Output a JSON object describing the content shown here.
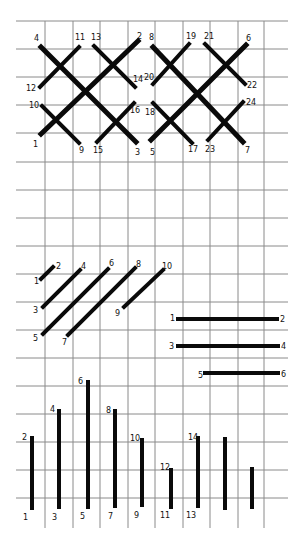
{
  "colors": {
    "background": "#ffffff",
    "grid": "#8a8a8a",
    "stitch": "#0a0a0a",
    "label": "#111111"
  },
  "grid": {
    "x_lines": [
      45,
      73,
      100,
      128,
      155,
      183,
      210,
      238,
      264
    ],
    "y_lines": [
      21,
      49,
      77,
      105,
      133,
      162,
      190,
      218,
      246,
      274,
      302,
      330,
      358,
      386,
      414,
      442,
      470,
      498
    ],
    "x_extent": [
      16,
      288
    ],
    "y_extent": [
      21,
      528
    ]
  },
  "diagrams": [
    {
      "name": "double-cross-stitch-row",
      "stitches": [
        {
          "x1": 41,
          "y1": 134,
          "x2": 138,
          "y2": 41,
          "w": 5
        },
        {
          "x1": 41,
          "y1": 47,
          "x2": 136,
          "y2": 142,
          "w": 5
        },
        {
          "x1": 40,
          "y1": 87,
          "x2": 79,
          "y2": 47,
          "w": 4
        },
        {
          "x1": 42,
          "y1": 106,
          "x2": 79,
          "y2": 143,
          "w": 4
        },
        {
          "x1": 94,
          "y1": 46,
          "x2": 135,
          "y2": 87,
          "w": 4
        },
        {
          "x1": 97,
          "y1": 142,
          "x2": 134,
          "y2": 103,
          "w": 4
        },
        {
          "x1": 151,
          "y1": 140,
          "x2": 246,
          "y2": 45,
          "w": 5
        },
        {
          "x1": 153,
          "y1": 47,
          "x2": 243,
          "y2": 142,
          "w": 5
        },
        {
          "x1": 153,
          "y1": 84,
          "x2": 189,
          "y2": 44,
          "w": 4
        },
        {
          "x1": 153,
          "y1": 103,
          "x2": 192,
          "y2": 143,
          "w": 4
        },
        {
          "x1": 205,
          "y1": 44,
          "x2": 245,
          "y2": 84,
          "w": 4
        },
        {
          "x1": 208,
          "y1": 140,
          "x2": 243,
          "y2": 102,
          "w": 4
        }
      ],
      "labels": [
        {
          "t": "4",
          "x": 34,
          "y": 41
        },
        {
          "t": "11",
          "x": 75,
          "y": 40
        },
        {
          "t": "13",
          "x": 91,
          "y": 40
        },
        {
          "t": "2",
          "x": 137,
          "y": 39
        },
        {
          "t": "8",
          "x": 149,
          "y": 40
        },
        {
          "t": "19",
          "x": 186,
          "y": 39
        },
        {
          "t": "21",
          "x": 204,
          "y": 39
        },
        {
          "t": "6",
          "x": 246,
          "y": 41
        },
        {
          "t": "12",
          "x": 26,
          "y": 91
        },
        {
          "t": "14",
          "x": 133,
          "y": 82
        },
        {
          "t": "20",
          "x": 144,
          "y": 80
        },
        {
          "t": "22",
          "x": 247,
          "y": 88
        },
        {
          "t": "10",
          "x": 29,
          "y": 108
        },
        {
          "t": "16",
          "x": 130,
          "y": 113
        },
        {
          "t": "18",
          "x": 145,
          "y": 115
        },
        {
          "t": "24",
          "x": 246,
          "y": 105
        },
        {
          "t": "1",
          "x": 33,
          "y": 147
        },
        {
          "t": "9",
          "x": 79,
          "y": 153
        },
        {
          "t": "15",
          "x": 93,
          "y": 153
        },
        {
          "t": "3",
          "x": 135,
          "y": 155
        },
        {
          "t": "5",
          "x": 150,
          "y": 155
        },
        {
          "t": "17",
          "x": 188,
          "y": 152
        },
        {
          "t": "23",
          "x": 205,
          "y": 152
        },
        {
          "t": "7",
          "x": 245,
          "y": 153
        }
      ]
    },
    {
      "name": "diagonal-stitches",
      "stitches": [
        {
          "x1": 41,
          "y1": 279,
          "x2": 53,
          "y2": 267,
          "w": 4
        },
        {
          "x1": 43,
          "y1": 307,
          "x2": 80,
          "y2": 270,
          "w": 4
        },
        {
          "x1": 43,
          "y1": 334,
          "x2": 108,
          "y2": 269,
          "w": 4
        },
        {
          "x1": 68,
          "y1": 335,
          "x2": 135,
          "y2": 268,
          "w": 4
        },
        {
          "x1": 124,
          "y1": 307,
          "x2": 163,
          "y2": 270,
          "w": 4
        }
      ],
      "labels": [
        {
          "t": "1",
          "x": 34,
          "y": 284
        },
        {
          "t": "2",
          "x": 56,
          "y": 269
        },
        {
          "t": "3",
          "x": 33,
          "y": 313
        },
        {
          "t": "4",
          "x": 81,
          "y": 269
        },
        {
          "t": "5",
          "x": 33,
          "y": 341
        },
        {
          "t": "6",
          "x": 109,
          "y": 266
        },
        {
          "t": "7",
          "x": 62,
          "y": 345
        },
        {
          "t": "8",
          "x": 136,
          "y": 267
        },
        {
          "t": "9",
          "x": 115,
          "y": 316
        },
        {
          "t": "10",
          "x": 162,
          "y": 269
        }
      ]
    },
    {
      "name": "horizontal-straight-stitches",
      "stitches": [
        {
          "x1": 178,
          "y1": 319,
          "x2": 277,
          "y2": 319,
          "w": 4
        },
        {
          "x1": 178,
          "y1": 346,
          "x2": 278,
          "y2": 346,
          "w": 4
        },
        {
          "x1": 205,
          "y1": 373,
          "x2": 278,
          "y2": 373,
          "w": 4
        }
      ],
      "labels": [
        {
          "t": "1",
          "x": 170,
          "y": 321
        },
        {
          "t": "2",
          "x": 280,
          "y": 322
        },
        {
          "t": "3",
          "x": 169,
          "y": 349
        },
        {
          "t": "4",
          "x": 281,
          "y": 349
        },
        {
          "t": "5",
          "x": 198,
          "y": 378
        },
        {
          "t": "6",
          "x": 281,
          "y": 377
        }
      ]
    },
    {
      "name": "vertical-straight-stitches",
      "stitches": [
        {
          "x1": 32,
          "y1": 438,
          "x2": 32,
          "y2": 508,
          "w": 4
        },
        {
          "x1": 59,
          "y1": 411,
          "x2": 59,
          "y2": 507,
          "w": 4
        },
        {
          "x1": 88,
          "y1": 382,
          "x2": 88,
          "y2": 507,
          "w": 4
        },
        {
          "x1": 115,
          "y1": 411,
          "x2": 115,
          "y2": 506,
          "w": 4
        },
        {
          "x1": 142,
          "y1": 440,
          "x2": 142,
          "y2": 505,
          "w": 4
        },
        {
          "x1": 171,
          "y1": 470,
          "x2": 171,
          "y2": 507,
          "w": 4
        },
        {
          "x1": 198,
          "y1": 438,
          "x2": 198,
          "y2": 506,
          "w": 4
        },
        {
          "x1": 225,
          "y1": 439,
          "x2": 225,
          "y2": 508,
          "w": 4
        },
        {
          "x1": 252,
          "y1": 469,
          "x2": 252,
          "y2": 507,
          "w": 4
        }
      ],
      "labels": [
        {
          "t": "2",
          "x": 22,
          "y": 440
        },
        {
          "t": "4",
          "x": 50,
          "y": 412
        },
        {
          "t": "6",
          "x": 78,
          "y": 384
        },
        {
          "t": "8",
          "x": 106,
          "y": 413
        },
        {
          "t": "10",
          "x": 130,
          "y": 441
        },
        {
          "t": "12",
          "x": 160,
          "y": 470
        },
        {
          "t": "14",
          "x": 188,
          "y": 440
        },
        {
          "t": "1",
          "x": 23,
          "y": 520
        },
        {
          "t": "3",
          "x": 52,
          "y": 520
        },
        {
          "t": "5",
          "x": 80,
          "y": 519
        },
        {
          "t": "7",
          "x": 108,
          "y": 519
        },
        {
          "t": "9",
          "x": 134,
          "y": 518
        },
        {
          "t": "11",
          "x": 160,
          "y": 518
        },
        {
          "t": "13",
          "x": 186,
          "y": 518
        }
      ]
    }
  ]
}
